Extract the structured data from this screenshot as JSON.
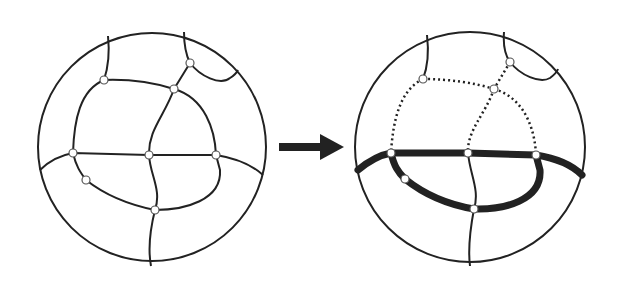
{
  "figure": {
    "colors": {
      "stroke": "#222222",
      "background": "#ffffff",
      "node_fill": "#ffffff"
    },
    "left_diagram": {
      "circle": {
        "cx": 152,
        "cy": 147,
        "r": 114
      },
      "nodes": [
        [
          104,
          80
        ],
        [
          174,
          89
        ],
        [
          190,
          63
        ],
        [
          73,
          153
        ],
        [
          149,
          155
        ],
        [
          216,
          155
        ],
        [
          86,
          180
        ],
        [
          155,
          210
        ]
      ]
    },
    "arrow": {
      "icon": "right-arrow-icon",
      "from": [
        279,
        147
      ],
      "to": [
        344,
        147
      ]
    },
    "right_diagram": {
      "circle": {
        "cx": 470,
        "cy": 147,
        "r": 115
      },
      "nodes": [
        [
          423,
          79
        ],
        [
          494,
          89
        ],
        [
          510,
          62
        ],
        [
          391,
          153
        ],
        [
          468,
          153
        ],
        [
          536,
          155
        ],
        [
          405,
          179
        ],
        [
          474,
          209
        ]
      ]
    }
  }
}
